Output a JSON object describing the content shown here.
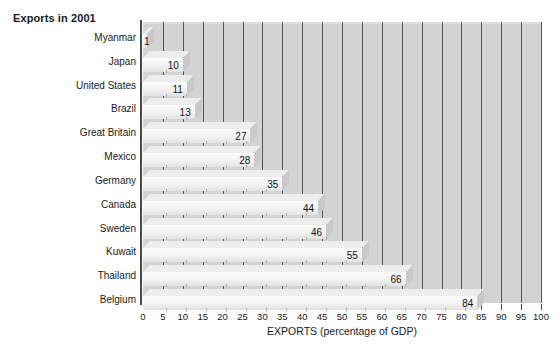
{
  "chart_data": {
    "type": "bar",
    "orientation": "horizontal",
    "title": "Exports in 2001",
    "xlabel": "EXPORTS (percentage of GDP)",
    "ylabel": "",
    "xlim": [
      0,
      100
    ],
    "xticks": [
      0,
      5,
      10,
      15,
      20,
      25,
      30,
      35,
      40,
      45,
      50,
      55,
      60,
      65,
      70,
      75,
      80,
      85,
      90,
      95,
      100
    ],
    "grid": true,
    "legend": "none",
    "style": "3d-isometric-bars",
    "categories": [
      "Myanmar",
      "Japan",
      "United States",
      "Brazil",
      "Great Britain",
      "Mexico",
      "Germany",
      "Canada",
      "Sweden",
      "Kuwait",
      "Thailand",
      "Belgium"
    ],
    "values": [
      1,
      10,
      11,
      13,
      27,
      28,
      35,
      44,
      46,
      55,
      66,
      84
    ],
    "value_labels": [
      "1",
      "10",
      "11",
      "13",
      "27",
      "28",
      "35",
      "44",
      "46",
      "55",
      "66",
      "84"
    ],
    "tick_labels": [
      "0",
      "5",
      "10",
      "15",
      "20",
      "25",
      "30",
      "35",
      "40",
      "45",
      "50",
      "55",
      "60",
      "65",
      "70",
      "75",
      "80",
      "85",
      "90",
      "95",
      "100"
    ]
  },
  "colors": {
    "plot_background": "#d3d3d3",
    "page_background": "#ffffff",
    "gridline": "#555555",
    "axis": "#4a4a4a",
    "bar_face": "#f2f2f2",
    "bar_top": "#ededed",
    "bar_cap": "#c9c9c9",
    "text": "#1a1a1a"
  }
}
